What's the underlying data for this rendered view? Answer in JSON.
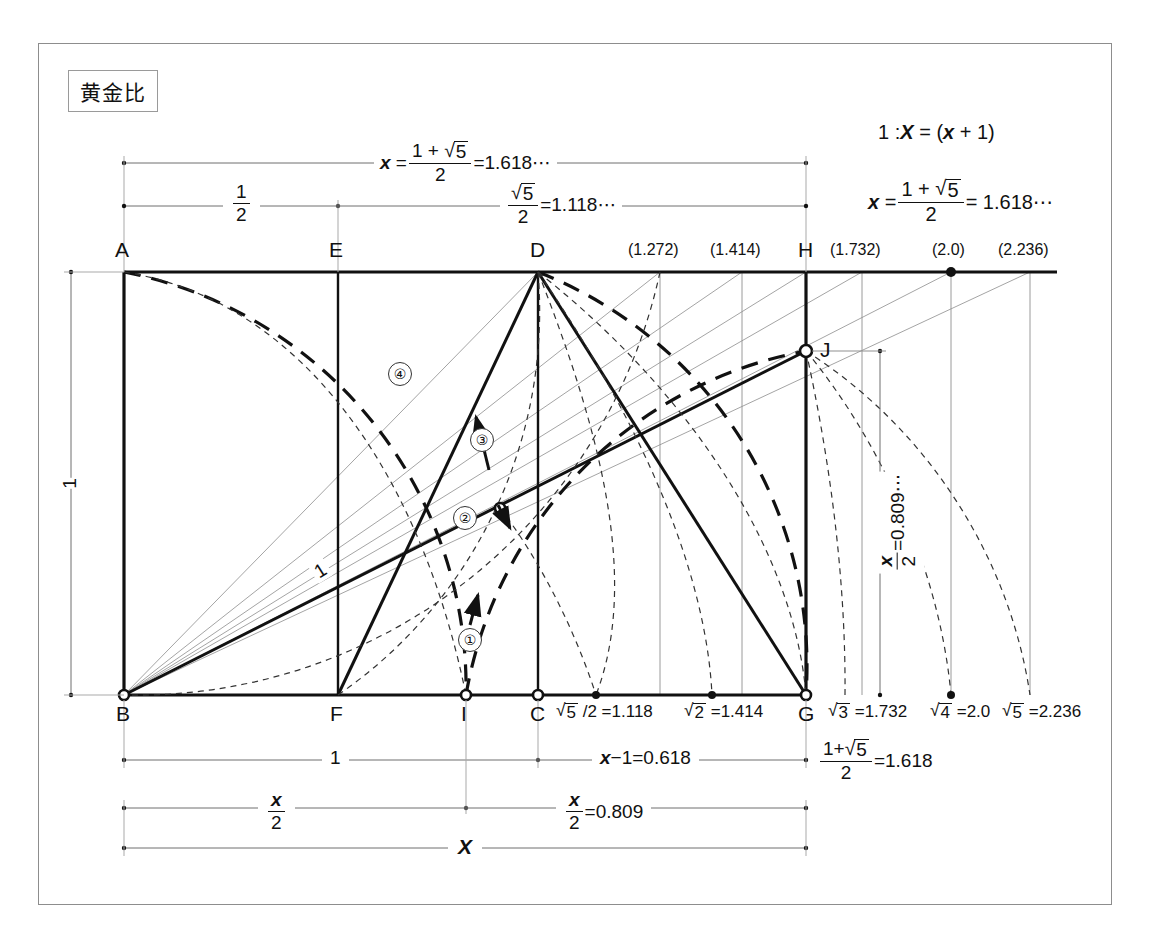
{
  "page": {
    "title": "黄金比"
  },
  "formulas": {
    "ratio_def": "1 : X = (x+1)",
    "x_value": "x = (1+√5)/2 = 1.618⋯",
    "top_dim_1": "x = (1+√5)/2 = 1.618⋯",
    "top_dim_2a": "1/2",
    "top_dim_2b": "√5/2 = 1.118⋯",
    "left_dim": "1",
    "right_dim": "x/2 = 0.809⋯",
    "bottom_dim_1a": "1",
    "bottom_dim_1b": "x−1 = 0.618",
    "bottom_dim_1c": "(1+√5)/2 = 1.618",
    "bottom_dim_2a": "x/2",
    "bottom_dim_2b": "x/2 = 0.809",
    "bottom_dim_3": "X",
    "diagonal_label": "1"
  },
  "parts": {
    "num": {
      "one": "1",
      "two": "2",
      "five": "5",
      "zero_809": "0.809",
      "eq": "="
    },
    "radical": "√"
  },
  "top_labels": [
    {
      "name": "A",
      "x": 124,
      "text": "A"
    },
    {
      "name": "E",
      "x": 338,
      "text": "E"
    },
    {
      "name": "D",
      "x": 538,
      "text": "D"
    },
    {
      "name": "p1272",
      "x": 660,
      "text": "(1.272)"
    },
    {
      "name": "p1414",
      "x": 742,
      "text": "(1.414)"
    },
    {
      "name": "H",
      "x": 806,
      "text": "H"
    },
    {
      "name": "p1732",
      "x": 862,
      "text": "(1.732)"
    },
    {
      "name": "p20",
      "x": 951,
      "text": "(2.0)"
    },
    {
      "name": "p2236",
      "x": 1030,
      "text": "(2.236)"
    }
  ],
  "bottom_labels": [
    {
      "name": "B",
      "x": 124,
      "text": "B"
    },
    {
      "name": "F",
      "x": 338,
      "text": "F"
    },
    {
      "name": "I",
      "x": 466,
      "text": "I"
    },
    {
      "name": "C",
      "x": 538,
      "text": "C"
    },
    {
      "name": "r5half",
      "x": 596,
      "text": "√5 /2 = 1.118"
    },
    {
      "name": "r2",
      "x": 712,
      "text": "√2 = 1.414"
    },
    {
      "name": "G",
      "x": 806,
      "text": "G"
    },
    {
      "name": "r3",
      "x": 845,
      "text": "√3 = 1.732"
    },
    {
      "name": "r4",
      "x": 951,
      "text": "√4 = 2.0"
    },
    {
      "name": "r5",
      "x": 1017,
      "text": "√5 = 2.236"
    }
  ],
  "step_markers": [
    {
      "name": "step-1",
      "label": "①",
      "x": 468,
      "y": 635
    },
    {
      "name": "step-2",
      "label": "②",
      "x": 464,
      "y": 513
    },
    {
      "name": "step-3",
      "label": "③",
      "x": 480,
      "y": 436
    },
    {
      "name": "step-4",
      "label": "④",
      "x": 398,
      "y": 370
    }
  ],
  "vertex_points": {
    "A": [
      124,
      272
    ],
    "B": [
      124,
      695
    ],
    "C": [
      538,
      695
    ],
    "D": [
      538,
      272
    ],
    "E": [
      338,
      272
    ],
    "F": [
      338,
      695
    ],
    "G": [
      806,
      695
    ],
    "H": [
      806,
      272
    ],
    "I": [
      466,
      695
    ],
    "J": [
      806,
      351
    ],
    "K": [
      500,
      508
    ],
    "M": [
      596,
      695
    ],
    "N": [
      712,
      695
    ],
    "P3": [
      845,
      695
    ],
    "P4": [
      951,
      695
    ],
    "P5": [
      1017,
      695
    ],
    "T1272": [
      660,
      272
    ],
    "T1414": [
      742,
      272
    ],
    "T1732": [
      862,
      272
    ],
    "T20": [
      951,
      272
    ],
    "T2236": [
      1030,
      272
    ]
  },
  "point_label_J": "J"
}
